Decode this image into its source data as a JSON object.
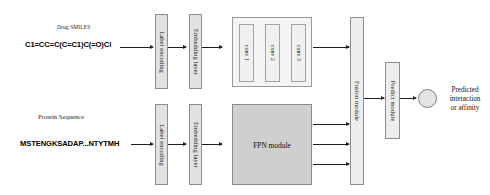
{
  "diagram": {
    "background_color": "#ffffff",
    "box_fill": "#e2e2e2",
    "fpn_fill": "#cfcfcf",
    "arrow_color": "#1d1d1d"
  },
  "drug_branch": {
    "caption": "Drug SMILES",
    "sequence": "C1=CC=C(C=C1)C(=O)Cl",
    "label_encoding": "Label encoding",
    "embedding_layer": "Embedding layer",
    "conv_group": {
      "blocks": [
        {
          "label": "conv 1"
        },
        {
          "label": "conv 2"
        },
        {
          "label": "conv 3"
        }
      ]
    }
  },
  "protein_branch": {
    "caption": "Protein Sequence",
    "sequence": "MSTENGKSADAP...NTYTMH",
    "label_encoding": "Label encoding",
    "embedding_layer": "Embedding layer",
    "fpn_module": "FPN module"
  },
  "fusion": {
    "label": "Fusion module"
  },
  "predict": {
    "label": "Predict module"
  },
  "output": {
    "line1": "Predicted",
    "line2": "interaction",
    "line3": "or affinity"
  }
}
